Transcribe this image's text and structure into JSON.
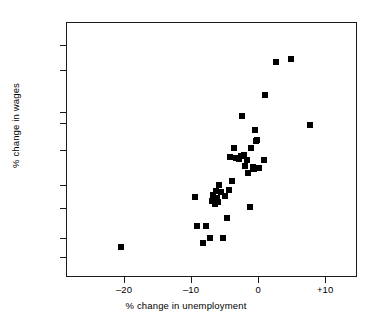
{
  "chart_data": {
    "type": "scatter",
    "title": "",
    "xlabel": "% change in unemployment",
    "ylabel": "% change in wages",
    "xscale": "linear",
    "yscale": "log",
    "xlim": [
      -28.5,
      14.9
    ],
    "ylim": [
      205,
      2350
    ],
    "grid": false,
    "legend": null,
    "xticks": [
      {
        "value": -20,
        "label": "–20"
      },
      {
        "value": -10,
        "label": "–10"
      },
      {
        "value": 0,
        "label": "0"
      },
      {
        "value": 10,
        "label": "+10"
      }
    ],
    "yticks": [
      {
        "value": 250,
        "label": "250"
      },
      {
        "value": 300,
        "label": "300"
      },
      {
        "value": 400,
        "label": "400"
      },
      {
        "value": 500,
        "label": "500"
      },
      {
        "value": 700,
        "label": "700"
      },
      {
        "value": 900,
        "label": "900"
      },
      {
        "value": 1000,
        "label": "1000"
      },
      {
        "value": 1500,
        "label": "1500"
      },
      {
        "value": 1900,
        "label": "1900"
      }
    ],
    "series": [
      {
        "name": "observations",
        "marker": "square",
        "color": "#000000",
        "points": [
          [
            -20.4,
            277
          ],
          [
            -9.4,
            443
          ],
          [
            -9.1,
            337
          ],
          [
            -8.2,
            287
          ],
          [
            -7.7,
            336
          ],
          [
            -7.1,
            300
          ],
          [
            -6.9,
            427
          ],
          [
            -6.8,
            445
          ],
          [
            -6.7,
            455
          ],
          [
            -6.6,
            437
          ],
          [
            -6.5,
            418
          ],
          [
            -6.4,
            430
          ],
          [
            -6.3,
            470
          ],
          [
            -6.2,
            441
          ],
          [
            -6.0,
            424
          ],
          [
            -5.8,
            500
          ],
          [
            -5.5,
            468
          ],
          [
            -5.2,
            300
          ],
          [
            -4.9,
            448
          ],
          [
            -4.6,
            363
          ],
          [
            -4.4,
            475
          ],
          [
            -4.2,
            655
          ],
          [
            -3.9,
            520
          ],
          [
            -3.6,
            712
          ],
          [
            -3.3,
            648
          ],
          [
            -2.9,
            640
          ],
          [
            -2.6,
            660
          ],
          [
            -2.4,
            963
          ],
          [
            -2.1,
            668
          ],
          [
            -1.9,
            600
          ],
          [
            -1.7,
            632
          ],
          [
            -1.5,
            560
          ],
          [
            -1.2,
            403
          ],
          [
            -1.0,
            712
          ],
          [
            -0.8,
            592
          ],
          [
            -0.6,
            580
          ],
          [
            -0.5,
            845
          ],
          [
            -0.3,
            762
          ],
          [
            -0.2,
            770
          ],
          [
            -0.1,
            588
          ],
          [
            0.2,
            586
          ],
          [
            0.9,
            634
          ],
          [
            1.1,
            1180
          ],
          [
            2.6,
            1620
          ],
          [
            4.9,
            1660
          ],
          [
            7.8,
            888
          ]
        ]
      }
    ]
  }
}
